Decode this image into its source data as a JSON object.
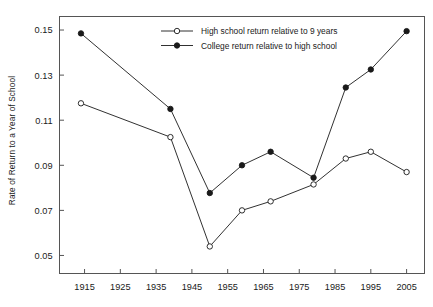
{
  "chart_data": {
    "type": "line",
    "title": "",
    "xlabel": "",
    "ylabel": "Rate of Return to a Year of School",
    "xlim": [
      1908,
      2010
    ],
    "ylim": [
      0.042,
      0.156
    ],
    "grid": false,
    "legend_position": "top-center",
    "xticks": [
      1915,
      1925,
      1935,
      1945,
      1955,
      1965,
      1975,
      1985,
      1995,
      2005
    ],
    "xtick_labels": [
      "1915",
      "1925",
      "1935",
      "1945",
      "1955",
      "1965",
      "1975",
      "1985",
      "1995",
      "2005"
    ],
    "yticks": [
      0.05,
      0.07,
      0.09,
      0.11,
      0.13,
      0.15
    ],
    "ytick_labels": [
      "0.05",
      "0.07",
      "0.09",
      "0.11",
      "0.13",
      "0.15"
    ],
    "x": [
      1914,
      1939,
      1950,
      1959,
      1967,
      1979,
      1988,
      1995,
      2005
    ],
    "series": [
      {
        "name": "High school return relative to 9 years",
        "marker": "open-circle",
        "color": "#1a1a1a",
        "values": [
          0.1175,
          0.1025,
          0.054,
          0.07,
          0.074,
          0.0815,
          0.093,
          0.096,
          0.087
        ]
      },
      {
        "name": "College return relative to high school",
        "marker": "filled-circle",
        "color": "#1a1a1a",
        "values": [
          0.1485,
          0.115,
          0.0777,
          0.09,
          0.096,
          0.0845,
          0.1245,
          0.1325,
          0.1495
        ]
      }
    ]
  },
  "axis": {
    "y_title": "Rate of Return to a Year of School"
  },
  "legend": {
    "entries": [
      {
        "label": "High school return relative to 9 years",
        "marker": "open-circle"
      },
      {
        "label": "College return relative to high school",
        "marker": "filled-circle"
      }
    ]
  },
  "style": {
    "line_color": "#1a1a1a",
    "frame_color": "#555555",
    "background": "#ffffff"
  }
}
